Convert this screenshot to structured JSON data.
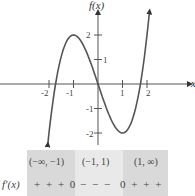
{
  "chart_data": {
    "type": "line",
    "title": "",
    "xlabel": "x",
    "ylabel": "f(x)",
    "xlim": [
      -2.5,
      2.6
    ],
    "ylim": [
      -2.3,
      2.9
    ],
    "x_ticks": [
      -2,
      -1,
      1,
      2
    ],
    "x_tick_labels": [
      "-2",
      "-1",
      "1",
      "2"
    ],
    "y_ticks": [
      -2,
      -1,
      1,
      2
    ],
    "y_tick_labels": [
      "-2",
      "-1",
      "1",
      "2"
    ],
    "grid": false,
    "series": [
      {
        "name": "f(x)",
        "function": "x^3 - 3x",
        "x": [
          -2.05,
          -1.75,
          -1.5,
          -1.25,
          -1.0,
          -0.75,
          -0.5,
          -0.25,
          0,
          0.25,
          0.5,
          0.75,
          1.0,
          1.25,
          1.5,
          1.75,
          2.1
        ],
        "y": [
          -2.47,
          -0.11,
          1.13,
          1.8,
          2.0,
          1.83,
          1.38,
          0.73,
          0,
          -0.73,
          -1.38,
          -1.83,
          -2.0,
          -1.8,
          -1.13,
          0.11,
          2.96
        ],
        "local_max": [
          -1,
          2
        ],
        "local_min": [
          1,
          -2
        ],
        "arrows_at_ends": true
      }
    ]
  },
  "sign_table": {
    "row_label": "f′(x)",
    "intervals": [
      {
        "label": "(−∞, −1)",
        "signs": "+ + + 0"
      },
      {
        "label": "(−1, 1)",
        "signs": "− − −"
      },
      {
        "label": "(1, ∞)",
        "signs": "0 + + +"
      }
    ]
  }
}
